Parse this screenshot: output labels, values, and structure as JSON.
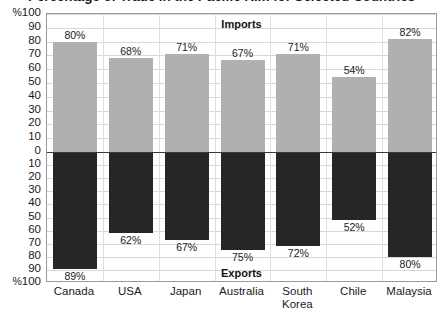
{
  "chart_data": {
    "type": "bar",
    "title": "Percentage of Trade in the Pacific Rim for Selected Countries",
    "xlabel": "",
    "ylabel": "%",
    "grid": true,
    "legend_position": "inside-top-and-bottom",
    "categories": [
      "Canada",
      "USA",
      "Japan",
      "Australia",
      "South Korea",
      "Chile",
      "Malaysia"
    ],
    "series": [
      {
        "name": "Imports",
        "direction": "up",
        "color": "#b0b0b0",
        "values": [
          80,
          68,
          71,
          67,
          71,
          54,
          82
        ],
        "value_labels": [
          "80%",
          "68%",
          "71%",
          "67%",
          "71%",
          "54%",
          "82%"
        ]
      },
      {
        "name": "Exports",
        "direction": "down",
        "color": "#262626",
        "values": [
          89,
          62,
          67,
          75,
          72,
          52,
          80
        ],
        "value_labels": [
          "89%",
          "62%",
          "67%",
          "75%",
          "72%",
          "52%",
          "80%"
        ]
      }
    ],
    "y_axis": {
      "upper_ticks": [
        "100",
        "90",
        "80",
        "70",
        "60",
        "50",
        "40",
        "30",
        "20",
        "10",
        "0"
      ],
      "lower_ticks": [
        "0",
        "10",
        "20",
        "30",
        "40",
        "50",
        "60",
        "70",
        "80",
        "90",
        "100"
      ],
      "percent_prefix": "%",
      "upper_range": [
        0,
        100
      ],
      "lower_range": [
        0,
        100
      ],
      "step": 10
    }
  },
  "labels": {
    "imports_section": "Imports",
    "exports_section": "Exports"
  }
}
